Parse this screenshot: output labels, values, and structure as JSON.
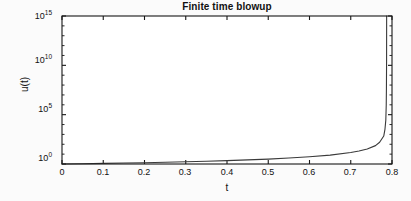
{
  "figure": {
    "background_color": "#fbfbfb",
    "axes_color": "#161616",
    "curve_color": "#3a3a3a"
  },
  "chart_data": {
    "type": "line",
    "title": "Finite time blowup",
    "xlabel": "t",
    "ylabel": "u(t)",
    "yscale": "log",
    "xscale": "linear",
    "xlim": [
      0,
      0.8
    ],
    "ylim": [
      1,
      1000000000000000.0
    ],
    "grid": false,
    "legend": null,
    "xticks": [
      0,
      0.1,
      0.2,
      0.3,
      0.4,
      0.5,
      0.6,
      0.7,
      0.8
    ],
    "xtick_labels": [
      "0",
      "0.1",
      "0.2",
      "0.3",
      "0.4",
      "0.5",
      "0.6",
      "0.7",
      "0.8"
    ],
    "yticks": [
      1,
      100000,
      10000000000,
      1000000000000000
    ],
    "ytick_mantissa": [
      "10",
      "10",
      "10",
      "10"
    ],
    "ytick_exponents": [
      "0",
      "5",
      "10",
      "15"
    ],
    "ytick_labels": [
      "10^0",
      "10^5",
      "10^10",
      "10^15"
    ],
    "blowup_time": 0.787,
    "series": [
      {
        "name": "u(t)",
        "x": [
          0.0,
          0.05,
          0.1,
          0.15,
          0.2,
          0.25,
          0.3,
          0.35,
          0.4,
          0.45,
          0.5,
          0.55,
          0.6,
          0.65,
          0.7,
          0.72,
          0.74,
          0.76,
          0.77,
          0.78,
          0.783,
          0.785,
          0.786,
          0.7865,
          0.78685,
          0.787
        ],
        "y": [
          1.0,
          1.07,
          1.15,
          1.25,
          1.36,
          1.5,
          1.68,
          1.9,
          2.2,
          2.6,
          3.15,
          4.0,
          5.4,
          8.0,
          14.5,
          20.5,
          33.0,
          73.0,
          160.0,
          680.0,
          3500.0,
          28000.0,
          900000.0,
          50000000.0,
          30000000000.0,
          1000000000000000.0
        ]
      }
    ]
  },
  "axes_geometry": {
    "plot_left": 62,
    "plot_right": 392,
    "plot_top": 16,
    "plot_bottom": 164
  }
}
